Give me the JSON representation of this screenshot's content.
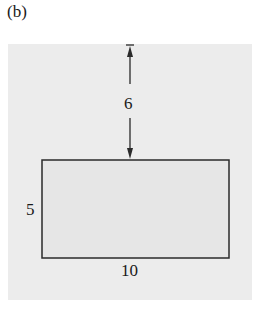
{
  "figure": {
    "panel_label": "(b)",
    "rectangle": {
      "width_label": "10",
      "height_label": "5"
    },
    "distance": {
      "label": "6"
    },
    "colors": {
      "panel_background": "#ececec",
      "rectangle_fill": "#e6e6e6",
      "stroke": "#2a2a2a"
    }
  }
}
